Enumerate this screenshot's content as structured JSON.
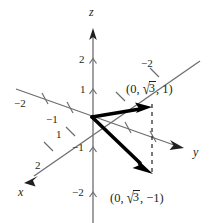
{
  "figure": {
    "axes": [
      {
        "name": "x",
        "label": "x"
      },
      {
        "name": "y",
        "label": "y"
      },
      {
        "name": "z",
        "label": "z"
      }
    ],
    "colors": {
      "axis": "#6d6e71",
      "vector": "#000000",
      "text": "#231f20",
      "background": "#ffffff"
    },
    "axis_labels": {
      "x": "x",
      "y": "y",
      "z": "z"
    },
    "tick_labels": {
      "z_positive_2": "2",
      "z_positive_1": "1",
      "z_negative_1": "−1",
      "z_negative_2": "−2",
      "y_negative_2": "−2",
      "y_positive_2": "−2",
      "y_positive_1": "−1",
      "x_1": "1",
      "x_2": "2"
    },
    "point_labels": {
      "upper": "(0, √3, 1)",
      "lower": "(0, √3, −1)"
    },
    "vectors": [
      {
        "name": "vector-upper",
        "label": "(0, √3, 1)",
        "components": [
          0,
          1.732,
          1
        ]
      },
      {
        "name": "vector-lower",
        "label": "(0, √3, −1)",
        "components": [
          0,
          1.732,
          -1
        ]
      }
    ],
    "sqrt_parts": {
      "open_upper": "(0, ",
      "radical": "√",
      "radicand": "3",
      "close_upper": ", 1)",
      "close_lower": ", −1)"
    }
  }
}
